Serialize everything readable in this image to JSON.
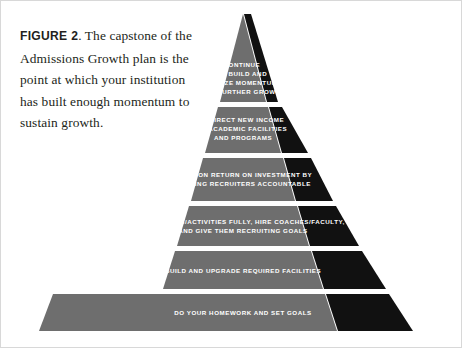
{
  "figure": {
    "label": "FIGURE 2",
    "caption_text": ". The capstone of the Admissions Growth plan is the point at which your institution has built enough momentum to sustain growth.",
    "caption_full": "FIGURE 2. The capstone of the Admissions Growth plan is the point at which your institution has built enough momentum to sustain growth."
  },
  "colors": {
    "face": "#6e6e6e",
    "shadow": "#111111",
    "text": "#ffffff",
    "caption": "#231f20",
    "background": "#ffffff",
    "border": "#d8d8d8"
  },
  "diagram": {
    "type": "pyramid",
    "name": "admissions-growth-pyramid",
    "orientation": "apex-top",
    "tier_count": 6,
    "tiers": [
      {
        "index": 1,
        "position": "apex",
        "lines": [
          "CONTINUE",
          "TO BUILD AND",
          "UTILIZE MOMENTUM",
          "FOR FURTHER GROWTH"
        ]
      },
      {
        "index": 2,
        "position": "second",
        "lines": [
          "REDIRECT NEW INCOME",
          "TO ACADEMIC FACILITIES",
          "AND PROGRAMS"
        ]
      },
      {
        "index": 3,
        "position": "third",
        "lines": [
          "FOCUS ON RETURN ON INVESTMENT BY",
          "HOLDING RECRUITERS ACCOUNTABLE"
        ]
      },
      {
        "index": 4,
        "position": "fourth",
        "lines": [
          "FUND TEAMS/ACTIVITIES FULLY, HIRE COACHES/FACULTY,",
          "AND GIVE THEM RECRUITING GOALS"
        ]
      },
      {
        "index": 5,
        "position": "fifth",
        "lines": [
          "BUILD AND UPGRADE REQUIRED FACILITIES"
        ]
      },
      {
        "index": 6,
        "position": "base",
        "lines": [
          "DO YOUR HOMEWORK AND SET GOALS"
        ]
      }
    ]
  }
}
